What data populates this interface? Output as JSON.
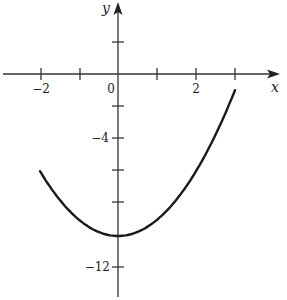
{
  "chart_data": {
    "type": "line",
    "title": "",
    "function": "y = x^2 - 10",
    "xlabel": "x",
    "ylabel": "y",
    "xlim": [
      -3,
      4
    ],
    "ylim": [
      -14,
      4
    ],
    "grid": false,
    "legend": null,
    "x_ticks": [
      -2,
      -1,
      1,
      2,
      3
    ],
    "x_tick_labels": [
      {
        "value": -2,
        "label": "−2"
      },
      {
        "value": 0,
        "label": "0"
      },
      {
        "value": 2,
        "label": "2"
      }
    ],
    "y_ticks": [
      2,
      -2,
      -4,
      -6,
      -8,
      -12
    ],
    "y_tick_labels": [
      {
        "value": -4,
        "label": "−4"
      },
      {
        "value": -12,
        "label": "−12"
      }
    ],
    "series": [
      {
        "name": "parabola",
        "x": [
          -2,
          -1.5,
          -1,
          -0.5,
          0,
          0.5,
          1,
          1.5,
          2,
          2.5,
          3
        ],
        "y": [
          -6,
          -7.75,
          -9,
          -9.75,
          -10,
          -9.75,
          -9,
          -7.75,
          -6,
          -3.75,
          -1
        ]
      }
    ],
    "colors": {
      "axis": "#333333",
      "curve": "#1a1a1a"
    }
  },
  "labels": {
    "x_axis": "x",
    "y_axis": "y",
    "origin": "0",
    "x_neg2": "−2",
    "x_pos2": "2",
    "y_neg4": "−4",
    "y_neg12": "−12"
  }
}
